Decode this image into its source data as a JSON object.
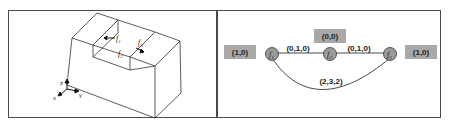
{
  "left_panel": {
    "face_labels": [
      "f1",
      "f2",
      "f3"
    ],
    "axes": {
      "x": "x",
      "y": "y",
      "z": "z"
    }
  },
  "right_panel": {
    "nodes": [
      {
        "id": "f1",
        "label": "f",
        "sub": "1",
        "attr": "(1,0)"
      },
      {
        "id": "f2",
        "label": "f",
        "sub": "2",
        "attr": "(0,0)"
      },
      {
        "id": "f3",
        "label": "f",
        "sub": "3",
        "attr": "(1,0)"
      }
    ],
    "edges": [
      {
        "from": "f1",
        "to": "f2",
        "label": "(0,1,0)"
      },
      {
        "from": "f2",
        "to": "f3",
        "label": "(0,1,0)"
      },
      {
        "from": "f1",
        "to": "f3",
        "label": "(2,3,2)"
      }
    ],
    "colors": {
      "node_fill": "#9a9a9a",
      "attr_box": "#a8a8a8",
      "line": "#333333"
    }
  }
}
